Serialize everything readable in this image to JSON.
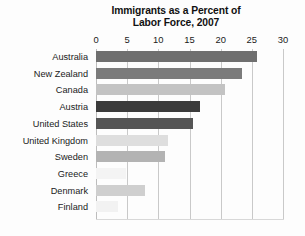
{
  "chart_data": {
    "type": "bar",
    "orientation": "horizontal",
    "title": "Immigrants as a Percent of Labor Force, 2007",
    "title_lines": [
      "Immigrants as a Percent of",
      "Labor Force, 2007"
    ],
    "xlabel": "",
    "ylabel": "",
    "xlim": [
      0,
      30
    ],
    "xticks": [
      0,
      5,
      10,
      15,
      20,
      25,
      30
    ],
    "xtick_labels": [
      "0",
      "5",
      "10",
      "15",
      "20",
      "25",
      "30"
    ],
    "grid": "vertical",
    "legend": "none",
    "categories": [
      "Australia",
      "New Zealand",
      "Canada",
      "Austria",
      "United States",
      "United Kingdom",
      "Sweden",
      "Greece",
      "Denmark",
      "Finland"
    ],
    "values": [
      25.9,
      23.4,
      20.7,
      16.7,
      15.6,
      11.6,
      11.0,
      4.8,
      7.9,
      3.5
    ],
    "bar_colors": [
      "#6f6f6f",
      "#7b7b7b",
      "#c3c3c3",
      "#3b3b3b",
      "#555555",
      "#dedede",
      "#b3b3b3",
      "#f4f4f4",
      "#cfcfcf",
      "#f2f2f2"
    ],
    "series": [
      {
        "name": "Immigrants as a Percent of Labor Force, 2007",
        "values": [
          25.9,
          23.4,
          20.7,
          16.7,
          15.6,
          11.6,
          11.0,
          4.8,
          7.9,
          3.5
        ]
      }
    ]
  },
  "colors": {
    "background": "#fdfdfd",
    "gridline": "#c9c9c9",
    "text": "#1a1a1a",
    "title": "#111111"
  }
}
